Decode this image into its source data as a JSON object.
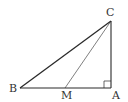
{
  "diagram": {
    "type": "geometry-right-triangle",
    "colors": {
      "stroke": "#2a2a2a",
      "label": "#333333",
      "background": "#ffffff"
    },
    "points": {
      "A": {
        "label": "A",
        "x": 111,
        "y": 88
      },
      "B": {
        "label": "B",
        "x": 20,
        "y": 88
      },
      "C": {
        "label": "C",
        "x": 111,
        "y": 21
      },
      "M": {
        "label": "M",
        "x": 65,
        "y": 88
      }
    },
    "segments": [
      "BC",
      "CA",
      "AB",
      "CM"
    ],
    "right_angle_at": "A"
  }
}
